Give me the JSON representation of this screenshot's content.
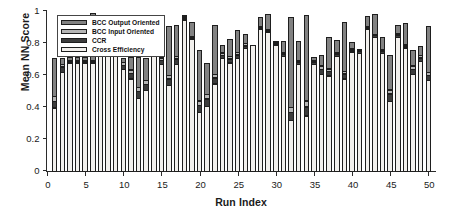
{
  "chart_data": {
    "type": "bar",
    "stacked": true,
    "title": "",
    "xlabel": "Run Index",
    "ylabel": "Mean NN Score",
    "xlim": [
      0,
      51
    ],
    "ylim": [
      0,
      1
    ],
    "xticks": [
      0,
      5,
      10,
      15,
      20,
      25,
      30,
      35,
      40,
      45,
      50
    ],
    "yticks": [
      0,
      0.2,
      0.4,
      0.6,
      0.8,
      1
    ],
    "ytick_labels": [
      "0",
      "0.2",
      "0.4",
      "0.6",
      "0.8",
      "1"
    ],
    "xtick_labels": [
      "0",
      "5",
      "10",
      "15",
      "20",
      "25",
      "30",
      "35",
      "40",
      "45",
      "50"
    ],
    "grid": false,
    "legend_position": "top-left-inside",
    "categories": [
      1,
      2,
      3,
      4,
      5,
      6,
      7,
      8,
      9,
      10,
      11,
      12,
      13,
      14,
      15,
      16,
      17,
      18,
      19,
      20,
      21,
      22,
      23,
      24,
      25,
      26,
      27,
      28,
      29,
      30,
      31,
      32,
      33,
      34,
      35,
      36,
      37,
      38,
      39,
      40,
      41,
      42,
      43,
      44,
      45,
      46,
      47,
      48,
      49,
      50
    ],
    "series": [
      {
        "name": "Cross Efficiency",
        "color": "#f2f0ed",
        "values": [
          0.4,
          0.62,
          0.68,
          0.68,
          0.68,
          0.68,
          0.72,
          0.72,
          0.72,
          0.64,
          0.58,
          0.46,
          0.51,
          0.72,
          0.67,
          0.54,
          0.67,
          0.95,
          0.83,
          0.37,
          0.41,
          0.55,
          0.71,
          0.68,
          0.71,
          0.77,
          0.79,
          0.89,
          0.87,
          0.79,
          0.72,
          0.32,
          0.67,
          0.35,
          0.67,
          0.61,
          0.6,
          0.72,
          0.58,
          0.75,
          0.74,
          0.89,
          0.84,
          0.74,
          0.44,
          0.84,
          0.77,
          0.61,
          0.69,
          0.57
        ]
      },
      {
        "name": "CCR",
        "color": "#3c3c3c",
        "values": [
          0.045,
          0.04,
          0.01,
          0.01,
          0.01,
          0.01,
          0.0,
          0.0,
          0.0,
          0.03,
          0.04,
          0.045,
          0.04,
          0.0,
          0.03,
          0.045,
          0.04,
          0.01,
          0.01,
          0.05,
          0.05,
          0.04,
          0.02,
          0.03,
          0.025,
          0.02,
          0.0,
          0.01,
          0.01,
          0.01,
          0.02,
          0.055,
          0.02,
          0.06,
          0.02,
          0.035,
          0.03,
          0.02,
          0.035,
          0.015,
          0.02,
          0.01,
          0.015,
          0.015,
          0.05,
          0.015,
          0.015,
          0.035,
          0.025,
          0.035
        ]
      },
      {
        "name": "BCC Input Oriented",
        "color": "#b6b6b6",
        "values": [
          0.035,
          0.02,
          0.01,
          0.01,
          0.01,
          0.01,
          0.0,
          0.0,
          0.0,
          0.02,
          0.025,
          0.03,
          0.03,
          0.0,
          0.02,
          0.025,
          0.02,
          0.01,
          0.01,
          0.03,
          0.03,
          0.025,
          0.02,
          0.02,
          0.02,
          0.02,
          0.0,
          0.01,
          0.01,
          0.01,
          0.015,
          0.035,
          0.015,
          0.04,
          0.015,
          0.025,
          0.02,
          0.015,
          0.02,
          0.015,
          0.015,
          0.01,
          0.01,
          0.015,
          0.03,
          0.015,
          0.015,
          0.025,
          0.02,
          0.025
        ]
      },
      {
        "name": "BCC Output Oriented",
        "color": "#828282",
        "values": [
          0.24,
          0.04,
          0.02,
          0.02,
          0.02,
          0.3,
          0.0,
          0.0,
          0.0,
          0.03,
          0.08,
          0.19,
          0.14,
          0.0,
          0.11,
          0.31,
          0.2,
          0.01,
          0.09,
          0.32,
          0.2,
          0.31,
          0.05,
          0.11,
          0.14,
          0.06,
          0.0,
          0.06,
          0.1,
          0.01,
          0.07,
          0.57,
          0.12,
          0.54,
          0.02,
          0.07,
          0.2,
          0.08,
          0.31,
          0.04,
          0.0,
          0.07,
          0.13,
          0.08,
          0.22,
          0.06,
          0.14,
          0.1,
          0.06,
          0.29
        ]
      }
    ],
    "legend_entries": [
      {
        "label": "BCC Output Oriented",
        "color": "#828282"
      },
      {
        "label": "BCC Input Oriented",
        "color": "#b6b6b6"
      },
      {
        "label": "CCR",
        "color": "#3c3c3c"
      },
      {
        "label": "Cross Efficiency",
        "color": "#f2f0ed"
      }
    ]
  },
  "axes": {
    "ylabel": "Mean NN Score",
    "xlabel": "Run Index"
  }
}
